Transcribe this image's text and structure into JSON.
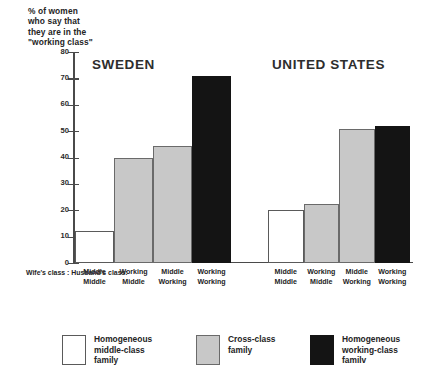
{
  "chart_data": {
    "type": "bar",
    "title": "",
    "ylabel": "% of women\nwho say that\nthey are in the\n\"working class\"",
    "xlabel": "",
    "ylim": [
      0,
      80
    ],
    "yticks": [
      0,
      10,
      20,
      30,
      40,
      50,
      60,
      70,
      80
    ],
    "grid": false,
    "legend_position": "bottom",
    "groups": [
      {
        "name": "SWEDEN",
        "categories": [
          "Middle / Middle",
          "Working / Middle",
          "Middle / Working",
          "Working / Working"
        ],
        "values": [
          12,
          40,
          44.5,
          71
        ],
        "fills": [
          "white",
          "gray",
          "gray",
          "black"
        ]
      },
      {
        "name": "UNITED STATES",
        "categories": [
          "Middle / Middle",
          "Working / Middle",
          "Middle / Working",
          "Working / Working"
        ],
        "values": [
          20,
          22.5,
          51,
          52
        ],
        "fills": [
          "white",
          "gray",
          "gray",
          "black"
        ]
      }
    ],
    "series": [
      {
        "name": "Homogeneous middle-class family",
        "color": "#ffffff",
        "values": [
          12,
          20
        ]
      },
      {
        "name": "Cross-class family",
        "color": "#c8c8c8",
        "values": [
          40,
          44.5,
          22.5,
          51
        ]
      },
      {
        "name": "Homogeneous working-class family",
        "color": "#141414",
        "values": [
          71,
          52
        ]
      }
    ],
    "legend": [
      {
        "label": "Homogeneous\nmiddle-class\nfamily",
        "color": "#ffffff"
      },
      {
        "label": "Cross-class\nfamily",
        "color": "#c8c8c8"
      },
      {
        "label": "Homogeneous\nworking-class\nfamilv",
        "color": "#141414"
      }
    ],
    "category_axis": {
      "row_labels": "Wife's class :\nHusband's class:",
      "wife_row": [
        "Middle",
        "Working",
        "Middle",
        "Working",
        "Middle",
        "Working",
        "Middle",
        "Working"
      ],
      "husband_row": [
        "Middle",
        "Middle",
        "Working",
        "Working",
        "Middle",
        "Middle",
        "Working",
        "Working"
      ]
    },
    "colors": {
      "white_fill": "#ffffff",
      "gray_fill": "#c8c8c8",
      "black_fill": "#141414",
      "axis": "#4a4a4a",
      "text": "#242424"
    }
  }
}
